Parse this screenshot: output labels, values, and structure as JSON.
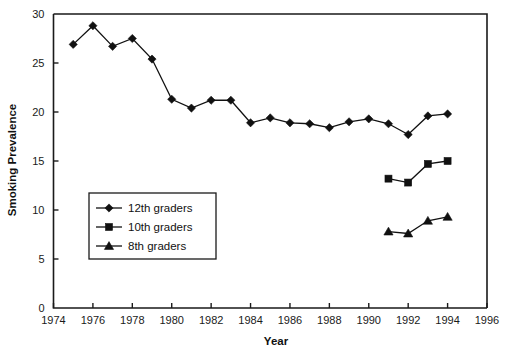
{
  "chart_data": {
    "type": "line",
    "title": "",
    "xlabel": "Year",
    "ylabel": "Smoking Prevalence",
    "xlim": [
      1974,
      1996
    ],
    "ylim": [
      0,
      30
    ],
    "xticks": [
      1974,
      1976,
      1978,
      1980,
      1982,
      1984,
      1986,
      1988,
      1990,
      1992,
      1994,
      1996
    ],
    "yticks": [
      0,
      5,
      10,
      15,
      20,
      25,
      30
    ],
    "grid": false,
    "legend_position": "lower-left-inside",
    "series": [
      {
        "name": "12th graders",
        "marker": "diamond",
        "x": [
          1975,
          1976,
          1977,
          1978,
          1979,
          1980,
          1981,
          1982,
          1983,
          1984,
          1985,
          1986,
          1987,
          1988,
          1989,
          1990,
          1991,
          1992,
          1993,
          1994
        ],
        "values": [
          26.9,
          28.8,
          26.7,
          27.5,
          25.4,
          21.3,
          20.4,
          21.2,
          21.2,
          18.9,
          19.4,
          18.9,
          18.8,
          18.4,
          19.0,
          19.3,
          18.8,
          17.7,
          19.6,
          19.8
        ]
      },
      {
        "name": "10th graders",
        "marker": "square",
        "x": [
          1991,
          1992,
          1993,
          1994
        ],
        "values": [
          13.2,
          12.8,
          14.7,
          15.0
        ]
      },
      {
        "name": "8th graders",
        "marker": "triangle",
        "x": [
          1991,
          1992,
          1993,
          1994
        ],
        "values": [
          7.8,
          7.6,
          8.9,
          9.3
        ]
      }
    ]
  },
  "legend": {
    "entries": [
      {
        "label": "12th graders",
        "marker": "diamond"
      },
      {
        "label": "10th graders",
        "marker": "square"
      },
      {
        "label": "8th graders",
        "marker": "triangle"
      }
    ]
  },
  "colors": {
    "ink": "#111111",
    "axis": "#1a1a1a",
    "background": "#ffffff"
  }
}
